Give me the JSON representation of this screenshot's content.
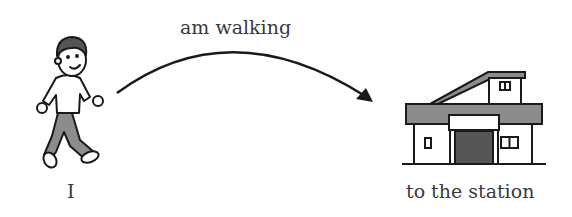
{
  "labels": {
    "subject": "I",
    "verb": "am walking",
    "destination": "to the station"
  },
  "icons": [
    "walking-boy-icon",
    "arrow-icon",
    "station-building-icon"
  ],
  "colors": {
    "line": "#1a1a1a",
    "gray": "#8c8c8c",
    "dark": "#555555",
    "text": "#3a3a3a"
  }
}
